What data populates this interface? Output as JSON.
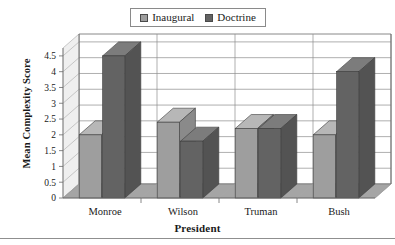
{
  "legend": {
    "entries": [
      {
        "label": "Inaugural",
        "color": "#9e9e9e",
        "swatch": "light"
      },
      {
        "label": "Doctrine",
        "color": "#636363",
        "swatch": "dark"
      }
    ]
  },
  "axes": {
    "y_title": "Mean Complexity Score",
    "x_title": "President"
  },
  "chart_data": {
    "type": "bar",
    "title": "",
    "xlabel": "President",
    "ylabel": "Mean Complexity Score",
    "categories": [
      "Monroe",
      "Wilson",
      "Truman",
      "Bush"
    ],
    "series": [
      {
        "name": "Inaugural",
        "color": "#9e9e9e",
        "values": [
          2.0,
          2.4,
          2.2,
          2.0
        ]
      },
      {
        "name": "Doctrine",
        "color": "#636363",
        "values": [
          4.5,
          1.8,
          2.2,
          4.0
        ]
      }
    ],
    "ylim": [
      0,
      4.75
    ],
    "ytick_labels": [
      "0",
      "0.5",
      "1",
      "1.5",
      "2",
      "2.5",
      "3",
      "3.5",
      "4",
      "4.5"
    ],
    "ytick_values": [
      0,
      0.5,
      1,
      1.5,
      2,
      2.5,
      3,
      3.5,
      4,
      4.5
    ],
    "grid": true,
    "legend_position": "top-center",
    "style": "3d-column"
  }
}
